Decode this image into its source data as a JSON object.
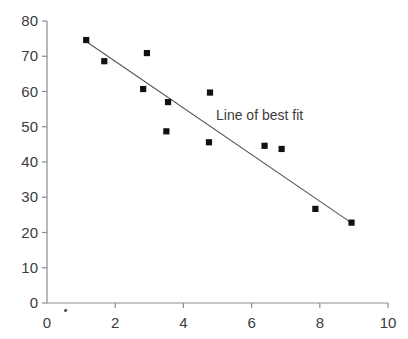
{
  "chart_data": {
    "type": "scatter",
    "title": "",
    "xlabel": "",
    "ylabel": "",
    "xlim": [
      0,
      10
    ],
    "ylim": [
      0,
      80
    ],
    "grid": false,
    "legend": "none",
    "xticks": [
      "0",
      "2",
      "4",
      "6",
      "8",
      "10"
    ],
    "xtick_values": [
      0,
      2,
      4,
      6,
      8,
      10
    ],
    "yticks": [
      "0",
      "10",
      "20",
      "30",
      "40",
      "50",
      "60",
      "70",
      "80"
    ],
    "ytick_values": [
      0,
      10,
      20,
      30,
      40,
      50,
      60,
      70,
      80
    ],
    "marker": "square",
    "marker_color": "#111111",
    "points": [
      {
        "x": 1.15,
        "y": 74.6
      },
      {
        "x": 1.68,
        "y": 68.6
      },
      {
        "x": 2.93,
        "y": 70.9
      },
      {
        "x": 2.82,
        "y": 60.7
      },
      {
        "x": 3.55,
        "y": 57.0
      },
      {
        "x": 3.5,
        "y": 48.7
      },
      {
        "x": 4.78,
        "y": 59.7
      },
      {
        "x": 4.75,
        "y": 45.6
      },
      {
        "x": 6.38,
        "y": 44.6
      },
      {
        "x": 6.88,
        "y": 43.7
      },
      {
        "x": 7.87,
        "y": 26.7
      },
      {
        "x": 8.93,
        "y": 22.8
      }
    ],
    "trendline": {
      "label": "Line of best fit",
      "color": "#555555",
      "x_start": 1.15,
      "y_start": 74.2,
      "x_end": 8.95,
      "y_end": 22.6
    },
    "stray_mark": {
      "x": 0.55,
      "y": -2.2
    },
    "axis_color": "#8c8c8c"
  }
}
